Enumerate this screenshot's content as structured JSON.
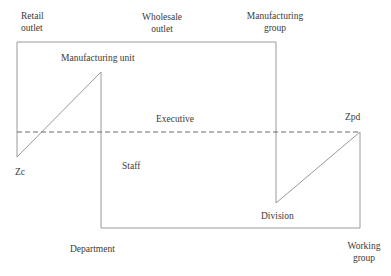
{
  "diagram": {
    "type": "organizational-cycle-diagram",
    "stroke_color": "#8a8a8a",
    "dashed_color": "#6a6a6a",
    "labels": {
      "retail_outlet": [
        "Retail",
        "outlet"
      ],
      "wholesale_outlet": [
        "Wholesale",
        "outlet"
      ],
      "manufacturing_group": [
        "Manufacturing",
        "group"
      ],
      "manufacturing_unit": "Manufacturing unit",
      "executive": "Executive",
      "zpd": "Zpd",
      "zc": "Zc",
      "staff": "Staff",
      "division": "Division",
      "department": "Department",
      "working_group": [
        "Working",
        "group"
      ]
    },
    "dashed_line_label": "Executive level reference line"
  }
}
